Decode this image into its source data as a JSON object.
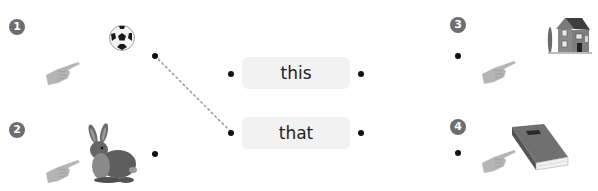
{
  "exercise": {
    "type": "matching",
    "items_left": [
      {
        "number": "1",
        "picture": "soccer-ball"
      },
      {
        "number": "2",
        "picture": "rabbit"
      }
    ],
    "items_right": [
      {
        "number": "3",
        "picture": "house"
      },
      {
        "number": "4",
        "picture": "book"
      }
    ],
    "words": [
      {
        "label": "this"
      },
      {
        "label": "that"
      }
    ],
    "connections": [
      {
        "from": "item-1",
        "to": "that",
        "style": "dashed"
      }
    ]
  },
  "colors": {
    "badge": "#6e6e6e",
    "word_box_bg": "#f2f2f2",
    "dot": "#111111",
    "dashed_line": "#9a9a9a",
    "hand": "#b5b5b5"
  }
}
